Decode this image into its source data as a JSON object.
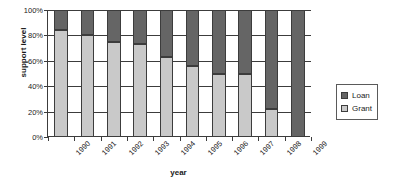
{
  "chart_data": {
    "type": "bar",
    "subtype": "100% stacked column",
    "title": "",
    "xlabel": "year",
    "ylabel": "support level",
    "categories": [
      "1990",
      "1991",
      "1992",
      "1993",
      "1994",
      "1995",
      "1996",
      "1997",
      "1998",
      "1999"
    ],
    "series": [
      {
        "name": "Grant",
        "color": "#c9c9c9",
        "values": [
          84,
          80,
          75,
          73,
          63,
          56,
          50,
          50,
          22,
          0
        ]
      },
      {
        "name": "Loan",
        "color": "#656565",
        "values": [
          16,
          20,
          25,
          27,
          37,
          44,
          50,
          50,
          78,
          100
        ]
      }
    ],
    "stack_order_bottom_to_top": [
      "Grant",
      "Loan"
    ],
    "ylim": [
      0,
      100
    ],
    "yticks": [
      "0%",
      "20%",
      "40%",
      "60%",
      "80%",
      "100%"
    ],
    "ytick_values": [
      0,
      20,
      40,
      60,
      80,
      100
    ],
    "ytick_unit": "%",
    "grid": "horizontal",
    "legend": {
      "position": "right",
      "bordered": true,
      "entries": [
        {
          "label": "Loan",
          "color": "#656565"
        },
        {
          "label": "Grant",
          "color": "#c9c9c9"
        }
      ]
    },
    "axis_color": "#3c3c3c",
    "background": "#ffffff"
  }
}
